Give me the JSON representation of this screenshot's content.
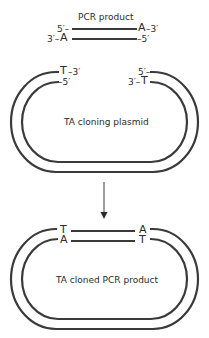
{
  "pcr_product": {
    "title": "PCR product",
    "top_strand_left": "5′–",
    "top_strand_right_base": "A",
    "top_strand_right_end": "–3′",
    "bottom_strand_left_end": "3′–",
    "bottom_strand_left_base": "A",
    "bottom_strand_right": "–5′"
  },
  "cloning_plasmid": {
    "label": "TA cloning plasmid",
    "left_outer_base": "T",
    "left_outer_end": "–3′",
    "left_inner_end": "–5′",
    "right_outer_end": "5′–",
    "right_inner_end": "3′–",
    "right_inner_base": "T"
  },
  "cloned_product": {
    "label": "TA cloned PCR product",
    "left_top_base": "T",
    "left_bottom_base": "A",
    "right_top_base": "A",
    "right_bottom_base": "T"
  },
  "colors": {
    "stroke": "#3a3a3a",
    "text": "#2b2b2b"
  }
}
